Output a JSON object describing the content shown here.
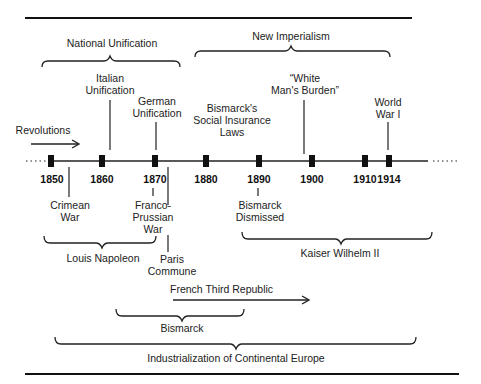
{
  "diagram": {
    "type": "timeline",
    "title": "",
    "years": [
      "1850",
      "1860",
      "1870",
      "1880",
      "1890",
      "1900",
      "1910",
      "1914"
    ],
    "above_events": [
      {
        "id": "revolutions",
        "label": "Revolutions",
        "year": "1848"
      },
      {
        "id": "italian-unification",
        "label_line1": "Italian",
        "label_line2": "Unification",
        "year": "1861"
      },
      {
        "id": "german-unification",
        "label_line1": "German",
        "label_line2": "Unification",
        "year": "1871"
      },
      {
        "id": "social-insurance",
        "label_line1": "Bismarck's",
        "label_line2": "Social Insurance",
        "label_line3": "Laws",
        "year": "1883-1889"
      },
      {
        "id": "white-mans-burden",
        "label_line1": "“White",
        "label_line2": "Man's Burden”",
        "year": "1899"
      },
      {
        "id": "world-war-i",
        "label_line1": "World",
        "label_line2": "War I",
        "year": "1914"
      }
    ],
    "below_events": [
      {
        "id": "crimean-war",
        "label_line1": "Crimean",
        "label_line2": "War",
        "year": "1854"
      },
      {
        "id": "franco-prussian-war",
        "label_line1": "Franco-",
        "label_line2": "Prussian",
        "label_line3": "War",
        "year": "1870"
      },
      {
        "id": "paris-commune",
        "label_line1": "Paris",
        "label_line2": "Commune",
        "year": "1871"
      },
      {
        "id": "bismarck-dismissed",
        "label_line1": "Bismarck",
        "label_line2": "Dismissed",
        "year": "1890"
      }
    ],
    "periods_above": [
      {
        "id": "national-unification",
        "label": "National Unification"
      },
      {
        "id": "new-imperialism",
        "label": "New Imperialism"
      }
    ],
    "periods_below": [
      {
        "id": "louis-napoleon",
        "label": "Louis Napoleon"
      },
      {
        "id": "kaiser-wilhelm-ii",
        "label": "Kaiser Wilhelm II"
      },
      {
        "id": "french-third-republic",
        "label": "French Third Republic"
      },
      {
        "id": "bismarck",
        "label": "Bismarck"
      },
      {
        "id": "industrialization",
        "label": "Industrialization of Continental Europe"
      }
    ]
  }
}
